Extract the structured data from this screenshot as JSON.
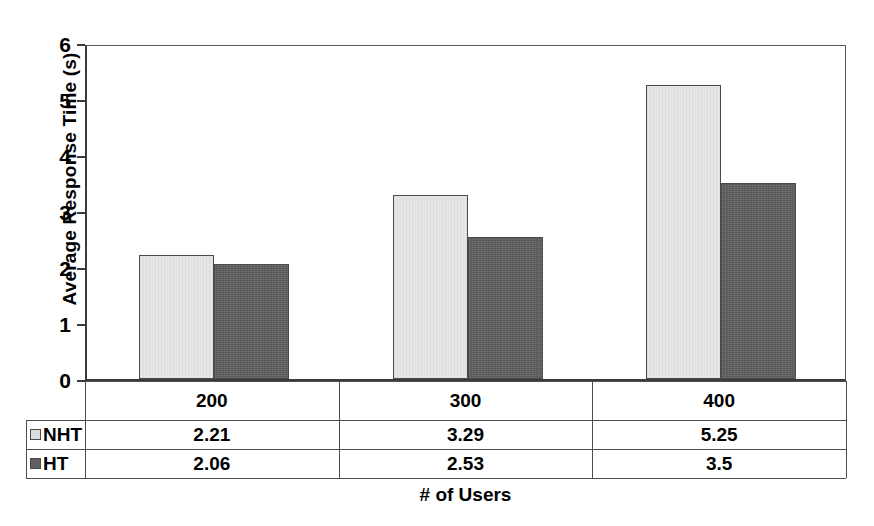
{
  "chart_data": {
    "type": "bar",
    "title": "",
    "xlabel": "# of Users",
    "ylabel": "Average Response Time (s)",
    "categories": [
      "200",
      "300",
      "400"
    ],
    "ylim": [
      0,
      6
    ],
    "yticks": [
      "0",
      "1",
      "2",
      "3",
      "4",
      "5",
      "6"
    ],
    "grid": false,
    "legend_position": "table-left-column",
    "series": [
      {
        "name": "NHT",
        "color": "#e9e9e9",
        "values": [
          2.21,
          3.29,
          5.25
        ],
        "labels": [
          "2.21",
          "3.29",
          "5.25"
        ]
      },
      {
        "name": "HT",
        "color": "#606060",
        "values": [
          2.06,
          2.53,
          3.5
        ],
        "labels": [
          "2.06",
          "2.53",
          "3.5"
        ]
      }
    ]
  },
  "table": {
    "legend_header": "",
    "row_labels": [
      "NHT",
      "HT"
    ]
  }
}
